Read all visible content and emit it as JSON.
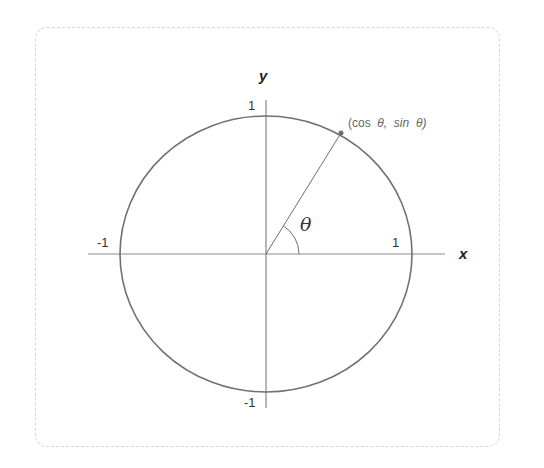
{
  "diagram": {
    "axes": {
      "x_label": "x",
      "y_label": "y"
    },
    "ticks": {
      "x_pos": "1",
      "x_neg": "-1",
      "y_pos": "1",
      "y_neg": "-1"
    },
    "angle_label": "θ",
    "point_label": {
      "open": "(cos",
      "theta1": "θ,",
      "sin": "sin",
      "theta2": "θ)"
    },
    "geometry": {
      "center": [
        266,
        254
      ],
      "radius": 146,
      "point": [
        341,
        133
      ],
      "stroke_color": "#6e6e6e",
      "axis_color": "#777777"
    }
  }
}
